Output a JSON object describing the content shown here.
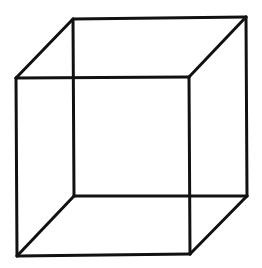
{
  "diagram": {
    "title": "Wireframe cube (Necker cube)",
    "stroke_color": "#111111",
    "background_color": "#ffffff",
    "stroke_width": 3,
    "vertices": {
      "back_top_left": [
        73,
        19
      ],
      "back_top_right": [
        246,
        17
      ],
      "back_bottom_left": [
        74,
        196
      ],
      "back_bottom_right": [
        247,
        196
      ],
      "front_top_left": [
        16,
        78
      ],
      "front_top_right": [
        189,
        77
      ],
      "front_bottom_left": [
        17,
        256
      ],
      "front_bottom_right": [
        190,
        254
      ]
    },
    "edges": [
      [
        "back_top_left",
        "back_top_right"
      ],
      [
        "back_top_right",
        "back_bottom_right"
      ],
      [
        "back_bottom_right",
        "back_bottom_left"
      ],
      [
        "back_bottom_left",
        "back_top_left"
      ],
      [
        "front_top_left",
        "front_top_right"
      ],
      [
        "front_top_right",
        "front_bottom_right"
      ],
      [
        "front_bottom_right",
        "front_bottom_left"
      ],
      [
        "front_bottom_left",
        "front_top_left"
      ],
      [
        "front_top_left",
        "back_top_left"
      ],
      [
        "front_top_right",
        "back_top_right"
      ],
      [
        "front_bottom_left",
        "back_bottom_left"
      ],
      [
        "front_bottom_right",
        "back_bottom_right"
      ]
    ]
  }
}
